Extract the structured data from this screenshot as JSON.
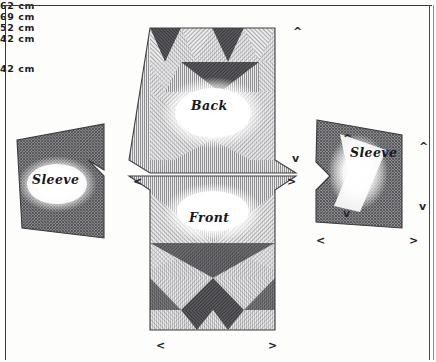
{
  "document": {
    "type": "hand-drawn garment pattern diagram",
    "title": "Sweater cutting layout"
  },
  "pieces": {
    "sleeve_left": {
      "label": "Sleeve"
    },
    "back": {
      "label": "Back"
    },
    "front": {
      "label": "Front"
    },
    "sleeve_right": {
      "label": "Sleeve"
    }
  },
  "dimensions": {
    "body_height": "62 cm",
    "body_shoulder_width": "69 cm",
    "body_hem_width": "52 cm",
    "sleeve_length": "42 cm",
    "sleeve_cuff_width": "42 cm",
    "sleeve_height_value": "32",
    "sleeve_height_unit": "cm"
  },
  "markers": {
    "up": "^",
    "down": "v",
    "left": "<",
    "right": ">"
  },
  "colors": {
    "ink": "#17171a",
    "paper": "#fdfdfc",
    "shade_dark": "#4a4a4c",
    "shade_mid": "#8e8e90",
    "shade_light": "#cfcfd0"
  }
}
